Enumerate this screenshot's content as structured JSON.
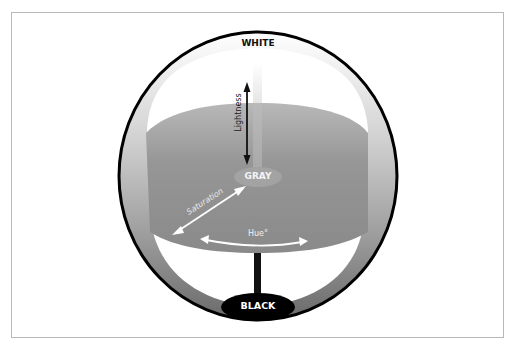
{
  "diagram": {
    "labels": {
      "top_pole": "WHITE",
      "center": "GRAY",
      "bottom_pole": "BLACK",
      "lightness_axis": "Lightness",
      "saturation_axis": "Saturation",
      "hue_axis": "Hue°"
    },
    "colors": {
      "sphere_outline": "#000000",
      "disc_fill": "#8f8f8f",
      "gray_center": "#9a9a9a",
      "black_pole": "#000000",
      "frame_border": "#b8b8b8",
      "arrow_light": "#ffffff",
      "arrow_dark": "#111111"
    }
  }
}
